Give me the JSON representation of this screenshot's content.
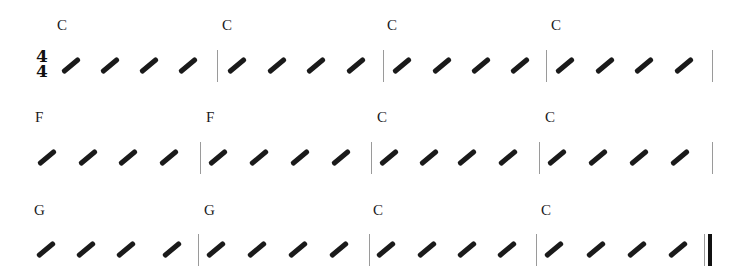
{
  "score": {
    "time_signature": {
      "numerator": "4",
      "denominator": "4"
    },
    "systems": [
      {
        "measures": [
          {
            "chord": "C",
            "beats": 4
          },
          {
            "chord": "C",
            "beats": 4
          },
          {
            "chord": "C",
            "beats": 4
          },
          {
            "chord": "C",
            "beats": 4
          }
        ]
      },
      {
        "measures": [
          {
            "chord": "F",
            "beats": 4
          },
          {
            "chord": "F",
            "beats": 4
          },
          {
            "chord": "C",
            "beats": 4
          },
          {
            "chord": "C",
            "beats": 4
          }
        ]
      },
      {
        "measures": [
          {
            "chord": "G",
            "beats": 4
          },
          {
            "chord": "G",
            "beats": 4
          },
          {
            "chord": "C",
            "beats": 4
          },
          {
            "chord": "C",
            "beats": 4
          }
        ],
        "ending": "final-barline"
      }
    ],
    "notation": "slash-rhythm",
    "colors": {
      "ink": "#1a1a1a",
      "barline": "#9a9a9a"
    }
  }
}
